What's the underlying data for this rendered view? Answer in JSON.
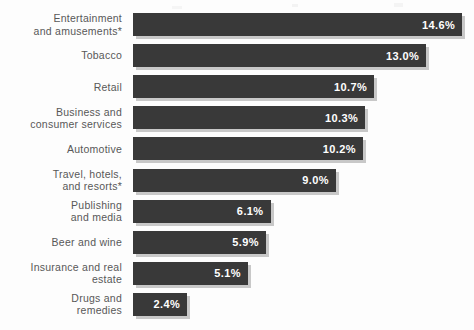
{
  "chart_data": {
    "type": "bar",
    "title": "",
    "subtitle": "",
    "xlabel": "",
    "ylabel": "",
    "orientation": "horizontal",
    "grid": false,
    "legend": null,
    "xlim": [
      0,
      14.6
    ],
    "value_suffix": "%",
    "categories": [
      "Entertainment and amusements*",
      "Tobacco",
      "Retail",
      "Business and consumer services",
      "Automotive",
      "Travel, hotels, and resorts*",
      "Publishing and media",
      "Beer and wine",
      "Insurance and real estate",
      "Drugs and remedies"
    ],
    "values": [
      14.6,
      13.0,
      10.7,
      10.3,
      10.2,
      9.0,
      6.1,
      5.9,
      5.1,
      2.4
    ],
    "bars": [
      {
        "label": "Entertainment\nand amusements*",
        "value": 14.6,
        "value_text": "14.6%"
      },
      {
        "label": "Tobacco",
        "value": 13.0,
        "value_text": "13.0%"
      },
      {
        "label": "Retail",
        "value": 10.7,
        "value_text": "10.7%"
      },
      {
        "label": "Business and\nconsumer services",
        "value": 10.3,
        "value_text": "10.3%"
      },
      {
        "label": "Automotive",
        "value": 10.2,
        "value_text": "10.2%"
      },
      {
        "label": "Travel, hotels,\nand resorts*",
        "value": 9.0,
        "value_text": "9.0%"
      },
      {
        "label": "Publishing\nand media",
        "value": 6.1,
        "value_text": "6.1%"
      },
      {
        "label": "Beer and wine",
        "value": 5.9,
        "value_text": "5.9%"
      },
      {
        "label": "Insurance and real\nestate",
        "value": 5.1,
        "value_text": "5.1%"
      },
      {
        "label": "Drugs and\nremedies",
        "value": 2.4,
        "value_text": "2.4%"
      }
    ]
  },
  "colors": {
    "bar": "#393939",
    "bar_shadow": "#c8c8c8",
    "value_text": "#ffffff",
    "label_text": "#585858",
    "background": "#fdfdfd"
  }
}
